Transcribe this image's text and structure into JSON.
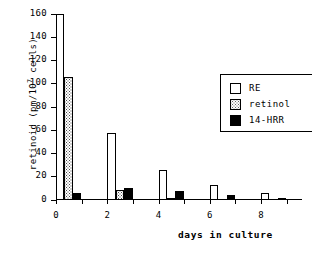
{
  "chart_data": {
    "type": "bar",
    "title": "",
    "xlabel": "days in culture",
    "ylabel": "retinoid (pm/10⁷ cells)",
    "ylabel_prefix": "retinoid (pm/10",
    "ylabel_sup": "7",
    "ylabel_suffix": " cells)",
    "xlim": [
      0,
      9.6
    ],
    "ylim": [
      0,
      160
    ],
    "yticks": [
      0,
      20,
      40,
      60,
      80,
      100,
      120,
      140,
      160
    ],
    "ytick_labels": [
      "0",
      "20",
      "40",
      "60",
      "80",
      "100",
      "120",
      "140",
      "160"
    ],
    "xticks": [
      0,
      1,
      2,
      3,
      4,
      5,
      6,
      7,
      8,
      9
    ],
    "xtick_labels": [
      "0",
      "",
      "2",
      "",
      "4",
      "",
      "6",
      "",
      "8",
      ""
    ],
    "grid": false,
    "legend_position": "upper right",
    "categories": [
      0,
      1,
      2,
      3,
      4,
      5,
      6,
      7,
      8,
      9
    ],
    "series": [
      {
        "name": "RE",
        "fill": "white",
        "color": "#ffffff",
        "values": [
          160,
          0,
          58,
          0,
          26,
          0,
          13,
          0,
          6,
          0
        ]
      },
      {
        "name": "retinol",
        "fill": "stipple",
        "color": "#bdbdbd",
        "values": [
          106,
          0,
          9,
          0,
          1.5,
          0,
          0,
          0,
          0,
          0
        ]
      },
      {
        "name": "14-HRR",
        "fill": "black",
        "color": "#000000",
        "values": [
          6,
          0,
          10,
          0,
          7.5,
          0,
          4.5,
          0,
          1,
          0
        ]
      }
    ],
    "bars": [
      {
        "day": 0,
        "series": "RE",
        "value": 160
      },
      {
        "day": 0,
        "series": "retinol",
        "value": 106
      },
      {
        "day": 0,
        "series": "14-HRR",
        "value": 6
      },
      {
        "day": 2,
        "series": "RE",
        "value": 58
      },
      {
        "day": 2,
        "series": "retinol",
        "value": 9
      },
      {
        "day": 2,
        "series": "14-HRR",
        "value": 10
      },
      {
        "day": 4,
        "series": "RE",
        "value": 26
      },
      {
        "day": 4,
        "series": "retinol",
        "value": 1.5
      },
      {
        "day": 4,
        "series": "14-HRR",
        "value": 7.5
      },
      {
        "day": 6,
        "series": "RE",
        "value": 13
      },
      {
        "day": 6,
        "series": "14-HRR",
        "value": 4.5
      },
      {
        "day": 8,
        "series": "RE",
        "value": 6
      },
      {
        "day": 8,
        "series": "14-HRR",
        "value": 1
      }
    ]
  },
  "legend": {
    "items": [
      {
        "label": "RE"
      },
      {
        "label": "retinol"
      },
      {
        "label": "14-HRR"
      }
    ]
  }
}
